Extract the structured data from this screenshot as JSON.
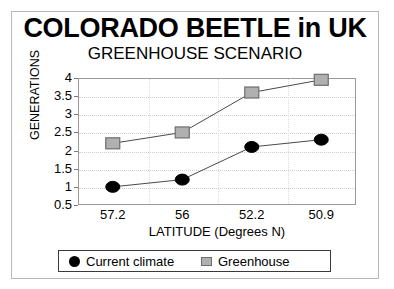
{
  "chart_data": {
    "type": "line",
    "title": "COLORADO BEETLE in UK",
    "subtitle": "GREENHOUSE SCENARIO",
    "xlabel": "LATITUDE (Degrees N)",
    "ylabel": "GENERATIONS",
    "categories": [
      "57.2",
      "56",
      "52.2",
      "50.9"
    ],
    "ylim": [
      0.5,
      4
    ],
    "yticks": [
      "4",
      "3.5",
      "3",
      "2.5",
      "2",
      "1.5",
      "1",
      "0.5"
    ],
    "grid": true,
    "legend_position": "bottom",
    "series": [
      {
        "name": "Current climate",
        "marker": "circle",
        "color": "#000000",
        "values": [
          1.0,
          1.2,
          2.1,
          2.3
        ]
      },
      {
        "name": "Greenhouse",
        "marker": "square",
        "color": "#b0b0b0",
        "values": [
          2.2,
          2.5,
          3.6,
          3.95
        ]
      }
    ]
  },
  "legend": {
    "items": [
      {
        "label": "Current climate",
        "marker": "circle-marker"
      },
      {
        "label": "Greenhouse",
        "marker": "square-marker"
      }
    ]
  }
}
